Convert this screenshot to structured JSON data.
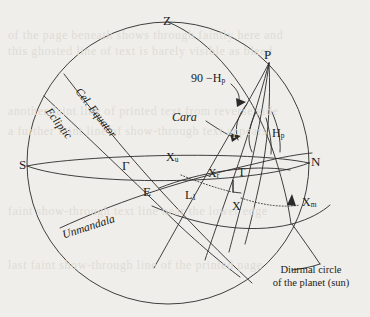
{
  "figure": {
    "background_color": "#efeeea",
    "line_color": "#2a2a2a",
    "caption": {
      "line1": "Diurmal circle",
      "line2": "of the planet (sun)"
    },
    "cardinal_points": {
      "zenith": "Z",
      "south": "S",
      "north": "N",
      "pole": "P",
      "east_center": "E"
    },
    "great_circles": [
      {
        "id": "cel-equator",
        "label": "Cel. Equator",
        "style": "italic"
      },
      {
        "id": "ecliptic",
        "label": "Ecliptic",
        "style": "italic"
      },
      {
        "id": "unmandala",
        "label": "Unmandala",
        "style": "italic"
      }
    ],
    "angles": [
      {
        "id": "ninety-minus-hp",
        "label": "90 −H",
        "sub": "p"
      },
      {
        "id": "hp",
        "label": "H",
        "sub": "p"
      },
      {
        "id": "cara",
        "label": "Cara",
        "style": "italic"
      }
    ],
    "points": [
      {
        "id": "vernal-equinox",
        "label": "Γ"
      },
      {
        "id": "xu",
        "label": "X",
        "sub": "u"
      },
      {
        "id": "xr",
        "label": "X",
        "sub": "r"
      },
      {
        "id": "xm",
        "label": "X",
        "sub": "m"
      },
      {
        "id": "x",
        "label": "X"
      },
      {
        "id": "t",
        "label": "T"
      },
      {
        "id": "l1",
        "label": "L",
        "sub": "1"
      }
    ]
  },
  "labels": {
    "zenith": "Z",
    "pole": "P",
    "south": "S",
    "north": "N",
    "east": "E",
    "gamma": "Γ",
    "xu_base": "X",
    "xu_sub": "u",
    "xr_base": "X",
    "xr_sub": "r",
    "xm_base": "X",
    "xm_sub": "m",
    "x": "X",
    "t": "T",
    "l1_base": "L",
    "l1_sub": "1",
    "hp_base": "H",
    "hp_sub": "p",
    "ninety_minus": "90 −",
    "cara": "Cara",
    "cel_equator": "Cel. Equator",
    "ecliptic": "Ecliptic",
    "unmandala": "Unmandala",
    "caption_line1": "Diurmal circle",
    "caption_line2": "of the planet (sun)"
  },
  "ghost_text": {
    "l1": "of the page beneath shows through faintly here and",
    "l2": "this ghosted line of text is barely visible as bleed",
    "l3": "another faint line of printed text from reverse side",
    "l4": "a further faint line of show-through text appears",
    "l5": "faint show-through text line near the lower edge",
    "l6": "last faint show-through line of the printed page"
  }
}
